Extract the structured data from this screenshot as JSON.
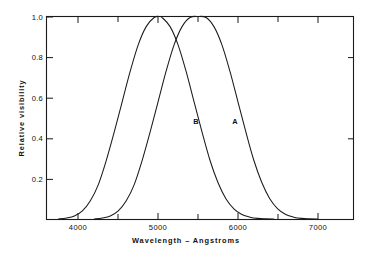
{
  "chart_data": {
    "type": "line",
    "title": "",
    "subtitle": "",
    "xlabel": "Wavelength – Angstroms",
    "ylabel": "Relative visibility",
    "xlim": [
      3650,
      7500
    ],
    "ylim": [
      0,
      1.0
    ],
    "grid": false,
    "legend_position": "inline-curve-labels",
    "xticks": [
      4000,
      5000,
      6000,
      7000
    ],
    "xtick_labels": [
      "4000",
      "5000",
      "6000",
      "7000"
    ],
    "xminorticks": [
      4500,
      5500,
      6500
    ],
    "yticks": [
      0.2,
      0.4,
      0.6,
      0.8,
      1.0
    ],
    "ytick_labels": [
      "0.2",
      "0.4",
      "0.6",
      "0.8",
      "1.0"
    ],
    "annotations": [
      {
        "text": "B",
        "x": 5430,
        "y": 0.5
      },
      {
        "text": "A",
        "x": 5920,
        "y": 0.5
      }
    ],
    "series": [
      {
        "name": "B",
        "label": "B",
        "peak_x": 5070,
        "peak_y": 1.0,
        "color": "#1a1a1a",
        "x": [
          3800,
          3900,
          4000,
          4100,
          4200,
          4300,
          4400,
          4500,
          4600,
          4700,
          4800,
          4900,
          5000,
          5070,
          5100,
          5200,
          5300,
          5400,
          5500,
          5600,
          5700,
          5800,
          5900,
          6000,
          6100,
          6200,
          6300,
          6400,
          6500
        ],
        "values": [
          0.0,
          0.005,
          0.015,
          0.04,
          0.09,
          0.17,
          0.29,
          0.43,
          0.58,
          0.73,
          0.86,
          0.95,
          0.995,
          1.0,
          0.995,
          0.95,
          0.86,
          0.73,
          0.58,
          0.43,
          0.29,
          0.18,
          0.1,
          0.05,
          0.022,
          0.009,
          0.003,
          0.001,
          0.0
        ]
      },
      {
        "name": "A",
        "label": "A",
        "peak_x": 5550,
        "peak_y": 1.0,
        "color": "#1a1a1a",
        "x": [
          4250,
          4350,
          4450,
          4550,
          4650,
          4750,
          4850,
          4950,
          5050,
          5150,
          5250,
          5350,
          5450,
          5550,
          5650,
          5750,
          5850,
          5950,
          6050,
          6150,
          6250,
          6350,
          6450,
          6550,
          6650,
          6750,
          6850,
          6950,
          7050
        ],
        "values": [
          0.0,
          0.005,
          0.015,
          0.04,
          0.09,
          0.17,
          0.29,
          0.43,
          0.58,
          0.73,
          0.86,
          0.95,
          0.995,
          1.0,
          0.995,
          0.95,
          0.86,
          0.73,
          0.58,
          0.43,
          0.29,
          0.18,
          0.1,
          0.05,
          0.022,
          0.009,
          0.003,
          0.001,
          0.0
        ]
      }
    ]
  },
  "axes": {
    "x_title": "Wavelength – Angstroms",
    "y_title": "Relative visibility"
  },
  "labels": {
    "curve_a": "A",
    "curve_b": "B",
    "x_tick_0": "4000",
    "x_tick_1": "5000",
    "x_tick_2": "6000",
    "x_tick_3": "7000",
    "y_tick_0": "0.2",
    "y_tick_1": "0.4",
    "y_tick_2": "0.6",
    "y_tick_3": "0.8",
    "y_tick_4": "1.0"
  },
  "colors": {
    "ink": "#1a1a1a",
    "background": "#ffffff"
  }
}
